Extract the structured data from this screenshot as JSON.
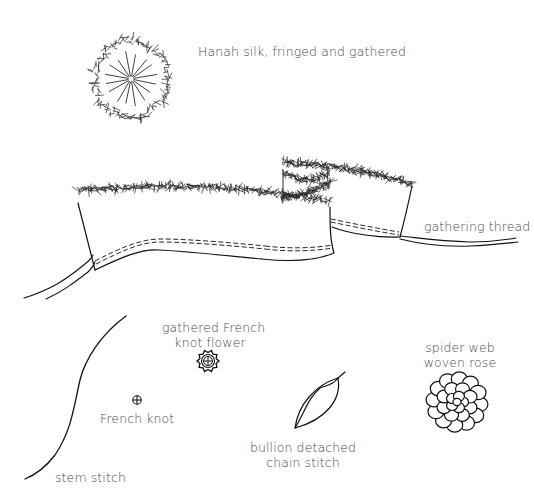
{
  "diagram": {
    "type": "embroidery stitch illustration",
    "colors": {
      "ink": "#111111",
      "label": "#4a4a4a",
      "background": "#ffffff"
    },
    "labels": {
      "hanah_silk": "Hanah silk, fringed and gathered",
      "gathering_thread": "gathering thread",
      "gathered_flower_line1": "gathered French",
      "gathered_flower_line2": "knot flower",
      "french_knot": "French knot",
      "spider_web_line1": "spider web",
      "spider_web_line2": "woven rose",
      "bullion_line1": "bullion detached",
      "bullion_line2": "chain stitch",
      "stem_stitch": "stem stitch"
    },
    "elements": [
      {
        "id": "hanah-silk-rosette",
        "icon": "fringed-circle"
      },
      {
        "id": "fringed-ribbon-strip",
        "icon": "gathered-ribbon"
      },
      {
        "id": "gathering-thread",
        "icon": "double-line-thread"
      },
      {
        "id": "stem-stitch-line",
        "icon": "s-curve"
      },
      {
        "id": "french-knot",
        "icon": "circled-cross"
      },
      {
        "id": "gathered-french-knot-flower",
        "icon": "scalloped-circled-cross"
      },
      {
        "id": "bullion-detached-chain-stitch",
        "icon": "leaf"
      },
      {
        "id": "spider-web-woven-rose",
        "icon": "clustered-petals"
      }
    ]
  }
}
